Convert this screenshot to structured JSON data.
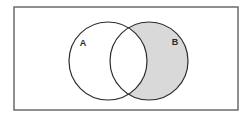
{
  "figure": {
    "type": "venn-diagram",
    "shaded_region": "B minus A",
    "universe": {
      "shape": "rectangle",
      "label": "",
      "x": 14,
      "y": 7,
      "width": 224,
      "height": 103,
      "border_color": "#6b6b6b",
      "border_width": 1.5,
      "fill_color": "#ffffff"
    },
    "sets": [
      {
        "id": "A",
        "label": "A",
        "cx": 108,
        "cy": 61,
        "r": 39,
        "fill": "#ffffff",
        "stroke": "#2b2b2b",
        "stroke_width": 1.2,
        "label_x": 83,
        "label_y": 44,
        "shaded": false
      },
      {
        "id": "B",
        "label": "B",
        "cx": 149,
        "cy": 61,
        "r": 39,
        "fill": "#d9d9d9",
        "stroke": "#2b2b2b",
        "stroke_width": 1.2,
        "label_x": 175,
        "label_y": 43,
        "shaded": true
      }
    ],
    "intersection": {
      "fill": "#ffffff",
      "shaded": false
    },
    "colors": {
      "shading": "#d9d9d9",
      "outline": "#2b2b2b",
      "frame": "#6b6b6b",
      "background": "#ffffff",
      "label_text": "#2b2b2b"
    }
  }
}
